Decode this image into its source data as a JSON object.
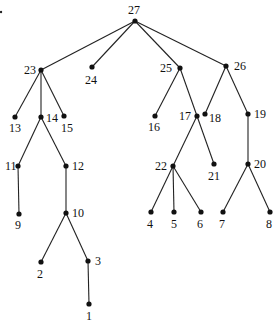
{
  "diagram": {
    "type": "tree",
    "root": "27",
    "nodes": [
      {
        "id": "27",
        "x": 135,
        "y": 21,
        "lx": 128,
        "ly": 14
      },
      {
        "id": "23",
        "x": 41,
        "y": 70,
        "lx": 24,
        "ly": 74
      },
      {
        "id": "24",
        "x": 92,
        "y": 67,
        "lx": 85,
        "ly": 84
      },
      {
        "id": "25",
        "x": 180,
        "y": 68,
        "lx": 160,
        "ly": 72
      },
      {
        "id": "26",
        "x": 226,
        "y": 66,
        "lx": 234,
        "ly": 70
      },
      {
        "id": "13",
        "x": 15,
        "y": 117,
        "lx": 9,
        "ly": 132
      },
      {
        "id": "14",
        "x": 41,
        "y": 117,
        "lx": 46,
        "ly": 122
      },
      {
        "id": "15",
        "x": 64,
        "y": 116,
        "lx": 61,
        "ly": 132
      },
      {
        "id": "16",
        "x": 155,
        "y": 116,
        "lx": 148,
        "ly": 131
      },
      {
        "id": "17",
        "x": 197,
        "y": 116,
        "lx": 179,
        "ly": 120
      },
      {
        "id": "18",
        "x": 205,
        "y": 114,
        "lx": 209,
        "ly": 122
      },
      {
        "id": "19",
        "x": 248,
        "y": 114,
        "lx": 254,
        "ly": 118
      },
      {
        "id": "11",
        "x": 18,
        "y": 166,
        "lx": 5,
        "ly": 170
      },
      {
        "id": "12",
        "x": 66,
        "y": 166,
        "lx": 72,
        "ly": 170
      },
      {
        "id": "22",
        "x": 173,
        "y": 166,
        "lx": 155,
        "ly": 170
      },
      {
        "id": "21",
        "x": 214,
        "y": 164,
        "lx": 208,
        "ly": 180
      },
      {
        "id": "20",
        "x": 248,
        "y": 164,
        "lx": 254,
        "ly": 168
      },
      {
        "id": "9",
        "x": 19,
        "y": 214,
        "lx": 15,
        "ly": 229
      },
      {
        "id": "10",
        "x": 66,
        "y": 213,
        "lx": 72,
        "ly": 217
      },
      {
        "id": "4",
        "x": 151,
        "y": 212,
        "lx": 147,
        "ly": 228
      },
      {
        "id": "5",
        "x": 174,
        "y": 212,
        "lx": 171,
        "ly": 228
      },
      {
        "id": "6",
        "x": 201,
        "y": 212,
        "lx": 197,
        "ly": 228
      },
      {
        "id": "7",
        "x": 223,
        "y": 212,
        "lx": 219,
        "ly": 228
      },
      {
        "id": "8",
        "x": 270,
        "y": 212,
        "lx": 266,
        "ly": 228
      },
      {
        "id": "2",
        "x": 41,
        "y": 262,
        "lx": 37,
        "ly": 278
      },
      {
        "id": "3",
        "x": 88,
        "y": 261,
        "lx": 95,
        "ly": 265
      },
      {
        "id": "1",
        "x": 89,
        "y": 304,
        "lx": 86,
        "ly": 320
      }
    ],
    "edges": [
      [
        "27",
        "23"
      ],
      [
        "27",
        "24"
      ],
      [
        "27",
        "25"
      ],
      [
        "27",
        "26"
      ],
      [
        "23",
        "13"
      ],
      [
        "23",
        "14"
      ],
      [
        "23",
        "15"
      ],
      [
        "14",
        "11"
      ],
      [
        "14",
        "12"
      ],
      [
        "11",
        "9"
      ],
      [
        "12",
        "10"
      ],
      [
        "10",
        "2"
      ],
      [
        "10",
        "3"
      ],
      [
        "3",
        "1"
      ],
      [
        "25",
        "16"
      ],
      [
        "25",
        "17"
      ],
      [
        "17",
        "22"
      ],
      [
        "17",
        "21"
      ],
      [
        "22",
        "4"
      ],
      [
        "22",
        "5"
      ],
      [
        "22",
        "6"
      ],
      [
        "26",
        "18"
      ],
      [
        "26",
        "19"
      ],
      [
        "19",
        "20"
      ],
      [
        "20",
        "7"
      ],
      [
        "20",
        "8"
      ]
    ]
  }
}
